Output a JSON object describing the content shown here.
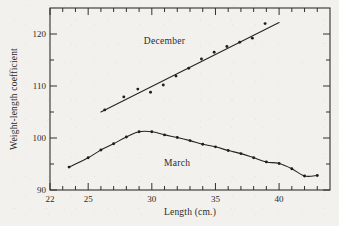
{
  "figure": {
    "background_color": "#f2f1ed",
    "ink_color": "#262523"
  },
  "chart_data": {
    "type": "scatter",
    "title": "",
    "subtitle": "",
    "xlabel": "Length (cm.)",
    "ylabel": "Weight-length coefficient",
    "xlim": [
      22,
      44
    ],
    "ylim": [
      90,
      125
    ],
    "grid": false,
    "legend_position": "inline-annotation",
    "x_major_ticks": [
      22,
      25,
      30,
      35,
      40
    ],
    "x_major_tick_labels": [
      "22",
      "25",
      "30",
      "35",
      "40"
    ],
    "x_minor_ticks": [
      23,
      24,
      26,
      27,
      28,
      29,
      31,
      32,
      33,
      34,
      36,
      37,
      38,
      39,
      41,
      42,
      43,
      44
    ],
    "y_major_ticks": [
      90,
      100,
      110,
      120
    ],
    "y_major_tick_labels": [
      "90",
      "100",
      "110",
      "120"
    ],
    "y_minor_ticks": [
      95,
      105,
      115,
      125
    ],
    "annotations": [
      {
        "text": "December",
        "x": 31.0,
        "y": 118.0
      },
      {
        "text": "March",
        "x": 32.0,
        "y": 94.6
      }
    ],
    "series": [
      {
        "name": "December",
        "marker": "dot",
        "fit": "linear",
        "fit_endpoints": [
          {
            "x": 26.0,
            "y": 105.0
          },
          {
            "x": 40.0,
            "y": 122.2
          }
        ],
        "x": [
          26.3,
          27.8,
          28.9,
          29.9,
          30.9,
          31.9,
          32.9,
          33.9,
          34.9,
          35.9,
          36.9,
          37.9,
          38.9
        ],
        "y": [
          105.4,
          107.9,
          109.4,
          108.8,
          110.2,
          111.9,
          113.4,
          115.2,
          116.5,
          117.6,
          118.4,
          119.2,
          122.0
        ],
        "values": [
          105.4,
          107.9,
          109.4,
          108.8,
          110.2,
          111.9,
          113.4,
          115.2,
          116.5,
          117.6,
          118.4,
          119.2,
          122.0
        ]
      },
      {
        "name": "March",
        "marker": "dot",
        "fit": "smooth-curve",
        "x": [
          23.5,
          25.0,
          26.0,
          27.0,
          28.0,
          29.0,
          30.0,
          31.0,
          32.0,
          33.0,
          34.0,
          35.0,
          36.0,
          37.0,
          38.0,
          39.0,
          40.0,
          41.0,
          42.0,
          43.0
        ],
        "y": [
          94.4,
          96.2,
          97.7,
          98.9,
          100.2,
          101.2,
          101.2,
          100.6,
          100.1,
          99.5,
          98.8,
          98.3,
          97.6,
          97.0,
          96.2,
          95.4,
          95.1,
          94.1,
          92.7,
          92.8
        ],
        "values": [
          94.4,
          96.2,
          97.7,
          98.9,
          100.2,
          101.2,
          101.2,
          100.6,
          100.1,
          99.5,
          98.8,
          98.3,
          97.6,
          97.0,
          96.2,
          95.4,
          95.1,
          94.1,
          92.7,
          92.8
        ]
      }
    ]
  }
}
